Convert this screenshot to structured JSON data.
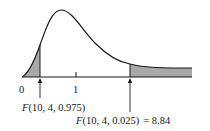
{
  "diagram": {
    "axis": {
      "tick_labels": [
        "0",
        "1"
      ]
    },
    "annotations": {
      "lower": {
        "fn": "F",
        "args": "(10, 4, 0.975)"
      },
      "upper": {
        "fn": "F",
        "args": "(10, 4, 0.025)",
        "equals": "= 8.84"
      }
    },
    "colors": {
      "curve": "#1a1a1a",
      "shade": "#a8a8a8",
      "background": "#ffffff"
    }
  }
}
